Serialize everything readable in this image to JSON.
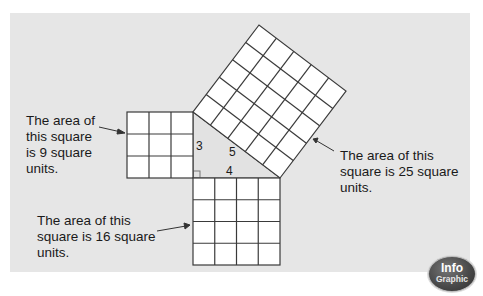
{
  "diagram": {
    "squares": [
      {
        "id": "left",
        "side": 3,
        "area": 9
      },
      {
        "id": "bottom",
        "side": 4,
        "area": 16
      },
      {
        "id": "hypotenuse",
        "side": 5,
        "area": 25
      }
    ],
    "side_labels": {
      "a": "3",
      "b": "4",
      "c": "5"
    },
    "callouts": {
      "left": [
        "The area of",
        "this square",
        "is 9 square",
        "units."
      ],
      "right": [
        "The area of this",
        "square is 25 square",
        "units."
      ],
      "bottom": [
        "The area of this",
        "square is 16 square",
        "units."
      ]
    },
    "colors": {
      "panel": "#e6e6e6",
      "grid_line": "#3a3a3a",
      "square_fill": "#ffffff"
    }
  },
  "badge": {
    "line1": "Info",
    "line2": "Graphic"
  }
}
